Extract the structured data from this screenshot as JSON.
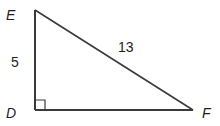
{
  "diagram": {
    "type": "right-triangle",
    "vertices": {
      "E": {
        "label": "E"
      },
      "D": {
        "label": "D"
      },
      "F": {
        "label": "F"
      }
    },
    "sides": {
      "ED": {
        "label": "5"
      },
      "EF": {
        "label": "13"
      }
    },
    "right_angle_at": "D",
    "colors": {
      "stroke": "#3a3a3a",
      "text": "#231f20"
    }
  }
}
